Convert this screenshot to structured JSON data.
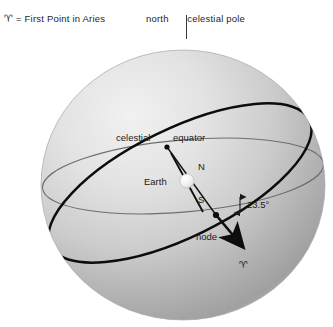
{
  "figure": {
    "kind": "celestial-sphere-diagram",
    "background_color": "#ffffff"
  },
  "legend": {
    "aries_symbol": "♈",
    "aries_definition": "= First Point in Aries",
    "north_pole_left": "north",
    "north_pole_right": "celestial pole"
  },
  "labels": {
    "celestial": "celestial",
    "equator": "equator",
    "earth": "Earth",
    "north_pole_initial": "N",
    "south_pole_initial": "S",
    "node": "node",
    "tilt_angle": "23.5°",
    "aries_point": "♈"
  },
  "colors": {
    "sphere_light": "#ededed",
    "sphere_mid": "#c9c9c9",
    "sphere_dark": "#9f9f9f",
    "equator_line": "#6b6b6b",
    "ecliptic_line": "#0d0d0d",
    "text": "#1b1b1b",
    "earth_body": "#f2f2f2"
  },
  "geometry": {
    "sphere_center_x": 183,
    "sphere_center_y": 185,
    "sphere_radius_x": 142,
    "sphere_radius_y": 135,
    "node_x": 216,
    "node_y": 215,
    "celestial_equator_node_x": 167,
    "celestial_equator_node_y": 147
  }
}
